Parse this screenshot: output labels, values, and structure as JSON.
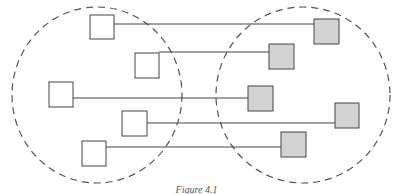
{
  "caption": "Figure 4.1",
  "colors": {
    "left_box_fill": "#ffffff",
    "right_box_fill": "#d3d3d3",
    "stroke": "#444444",
    "circle_stroke": "#555555"
  },
  "groups": [
    {
      "name": "left-set",
      "cx": 97,
      "cy": 95,
      "rx": 85,
      "ry": 88
    },
    {
      "name": "right-set",
      "cx": 303,
      "cy": 95,
      "rx": 87,
      "ry": 88
    }
  ],
  "links": [
    {
      "left": {
        "x": 90,
        "y": 15,
        "w": 24,
        "h": 24
      },
      "right": {
        "x": 314,
        "y": 19,
        "w": 25,
        "h": 25
      },
      "line_y": 24
    },
    {
      "left": {
        "x": 135,
        "y": 53,
        "w": 24,
        "h": 25
      },
      "right": {
        "x": 269,
        "y": 44,
        "w": 25,
        "h": 25
      },
      "line_y": 52
    },
    {
      "left": {
        "x": 49,
        "y": 82,
        "w": 24,
        "h": 25
      },
      "right": {
        "x": 248,
        "y": 86,
        "w": 25,
        "h": 25
      },
      "line_y": 98
    },
    {
      "left": {
        "x": 122,
        "y": 111,
        "w": 25,
        "h": 25
      },
      "right": {
        "x": 335,
        "y": 103,
        "w": 24,
        "h": 25
      },
      "line_y": 123
    },
    {
      "left": {
        "x": 82,
        "y": 141,
        "w": 24,
        "h": 25
      },
      "right": {
        "x": 281,
        "y": 132,
        "w": 25,
        "h": 25
      },
      "line_y": 147
    }
  ]
}
